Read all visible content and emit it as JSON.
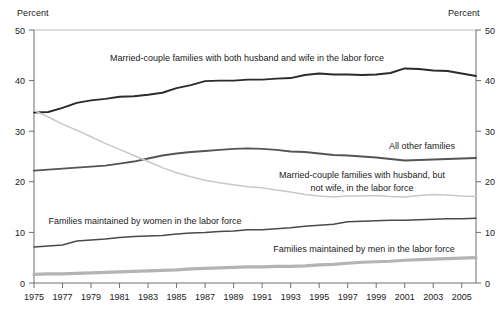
{
  "chart_data": {
    "type": "line",
    "title": "",
    "subtitle": "",
    "xlabel": "",
    "ylabel": "Percent",
    "ylabel_right": "Percent",
    "xlim": [
      1975,
      2006
    ],
    "ylim": [
      0,
      50
    ],
    "yticks": [
      0,
      10,
      20,
      30,
      40,
      50
    ],
    "xticks": [
      1975,
      1977,
      1979,
      1981,
      1983,
      1985,
      1987,
      1989,
      1991,
      1993,
      1995,
      1997,
      1999,
      2001,
      2003,
      2005
    ],
    "grid": false,
    "legend_position": "inline-annotations",
    "x": [
      1975,
      1976,
      1977,
      1978,
      1979,
      1980,
      1981,
      1982,
      1983,
      1984,
      1985,
      1986,
      1987,
      1988,
      1989,
      1990,
      1991,
      1992,
      1993,
      1994,
      1995,
      1996,
      1997,
      1998,
      1999,
      2000,
      2001,
      2002,
      2003,
      2004,
      2005,
      2006
    ],
    "series": [
      {
        "name": "Married-couple families with both husband and wife in the labor force",
        "color": "#2b2b2b",
        "width": 1.9,
        "values": [
          33.7,
          33.8,
          34.6,
          35.6,
          36.1,
          36.4,
          36.8,
          36.9,
          37.2,
          37.6,
          38.5,
          39.1,
          39.9,
          40.0,
          40.0,
          40.2,
          40.2,
          40.4,
          40.5,
          41.1,
          41.4,
          41.2,
          41.2,
          41.1,
          41.2,
          41.5,
          42.4,
          42.3,
          42.0,
          41.9,
          41.4,
          40.9
        ]
      },
      {
        "name": "All other families",
        "color": "#555555",
        "width": 1.9,
        "values": [
          22.2,
          22.4,
          22.6,
          22.8,
          23.0,
          23.2,
          23.6,
          24.0,
          24.6,
          25.2,
          25.6,
          25.9,
          26.1,
          26.3,
          26.5,
          26.6,
          26.5,
          26.3,
          26.0,
          25.9,
          25.6,
          25.3,
          25.2,
          25.0,
          24.8,
          24.5,
          24.2,
          24.3,
          24.4,
          24.5,
          24.6,
          24.7
        ]
      },
      {
        "name": "Married-couple families with husband, but not wife, in the labor force",
        "color": "#c8c8c8",
        "width": 1.5,
        "values": [
          34.1,
          32.8,
          31.4,
          30.2,
          28.9,
          27.6,
          26.4,
          25.2,
          24.0,
          22.8,
          21.8,
          21.0,
          20.3,
          19.8,
          19.4,
          19.0,
          18.8,
          18.4,
          18.0,
          17.5,
          17.2,
          17.0,
          17.2,
          17.2,
          17.3,
          17.1,
          17.0,
          17.3,
          17.5,
          17.4,
          17.2,
          17.1
        ]
      },
      {
        "name": "Families maintained by women in the labor force",
        "color": "#4a4a4a",
        "width": 1.5,
        "values": [
          7.1,
          7.3,
          7.5,
          8.3,
          8.5,
          8.7,
          9.0,
          9.2,
          9.3,
          9.4,
          9.7,
          9.9,
          10.0,
          10.2,
          10.3,
          10.5,
          10.5,
          10.7,
          10.9,
          11.2,
          11.4,
          11.6,
          12.1,
          12.2,
          12.3,
          12.4,
          12.4,
          12.5,
          12.6,
          12.7,
          12.7,
          12.8
        ]
      },
      {
        "name": "Families maintained by men in the labor force",
        "color": "#b4b4b4",
        "width": 3.2,
        "values": [
          1.7,
          1.8,
          1.8,
          1.9,
          2.0,
          2.1,
          2.2,
          2.3,
          2.4,
          2.5,
          2.6,
          2.8,
          2.9,
          3.0,
          3.1,
          3.2,
          3.2,
          3.3,
          3.3,
          3.4,
          3.6,
          3.7,
          3.9,
          4.1,
          4.2,
          4.3,
          4.5,
          4.6,
          4.7,
          4.8,
          4.9,
          5.0
        ]
      }
    ],
    "annotations": [
      {
        "id": "label-both-spouses",
        "text": "Married-couple families with both husband and wife in the labor force",
        "x": 247,
        "y": 61,
        "anchor": "middle"
      },
      {
        "id": "label-all-other",
        "text": "All other families",
        "x": 422,
        "y": 149,
        "anchor": "middle"
      },
      {
        "id": "label-husband-only-line1",
        "text": "Married-couple families with husband, but",
        "x": 362,
        "y": 178,
        "anchor": "middle"
      },
      {
        "id": "label-husband-only-line2",
        "text": "not wife, in the labor force",
        "x": 362,
        "y": 191,
        "anchor": "middle"
      },
      {
        "id": "label-women-maintained",
        "text": "Families maintained by women in the labor force",
        "x": 145,
        "y": 224,
        "anchor": "middle"
      },
      {
        "id": "label-men-maintained",
        "text": "Families maintained by men in the labor force",
        "x": 364,
        "y": 252,
        "anchor": "middle"
      }
    ]
  },
  "axes": {
    "left_title": "Percent",
    "right_title": "Percent"
  }
}
